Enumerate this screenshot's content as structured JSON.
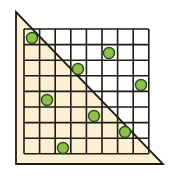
{
  "diagram": {
    "title": "",
    "grid": {
      "cols": 8,
      "rows": 8,
      "x": 24,
      "y": 29,
      "cell": 15.6,
      "line_color": "#1f1a14",
      "fill": "#ffffff"
    },
    "triangle": {
      "points": [
        [
          16,
          12
        ],
        [
          16,
          164
        ],
        [
          163,
          164
        ]
      ],
      "fill": "#fcf0d2",
      "stroke": "#1f1a14"
    },
    "dots": [
      {
        "cx": 32,
        "cy": 38
      },
      {
        "cx": 109,
        "cy": 53
      },
      {
        "cx": 78,
        "cy": 69
      },
      {
        "cx": 141,
        "cy": 85
      },
      {
        "cx": 47,
        "cy": 100
      },
      {
        "cx": 94,
        "cy": 116
      },
      {
        "cx": 125,
        "cy": 132
      },
      {
        "cx": 63,
        "cy": 148
      }
    ],
    "dot_style": {
      "r": 5.5,
      "fill": "#8dc04a",
      "stroke": "#2f4a1a"
    }
  }
}
